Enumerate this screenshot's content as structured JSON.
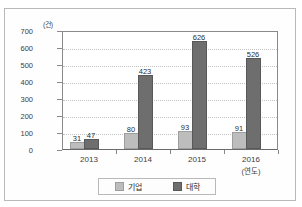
{
  "chart_data": {
    "type": "bar",
    "title": "",
    "xlabel": "(연도)",
    "ylabel": "(건)",
    "categories": [
      "2013",
      "2014",
      "2015",
      "2016"
    ],
    "series": [
      {
        "name": "기업",
        "values": [
          31,
          80,
          93,
          91
        ],
        "color": "#bdbdbd"
      },
      {
        "name": "대학",
        "values": [
          47,
          423,
          626,
          526
        ],
        "color": "#6e6e6e"
      }
    ],
    "ylim": [
      0,
      700
    ],
    "ytick_step": 100,
    "yticks": [
      "0",
      "100",
      "200",
      "300",
      "400",
      "500",
      "600",
      "700"
    ],
    "grid": true,
    "legend_position": "bottom"
  },
  "axis": {
    "unit_label": "(건)",
    "x_unit_label": "(연도)"
  },
  "legend": {
    "items": [
      {
        "label": "기업",
        "color": "#bdbdbd"
      },
      {
        "label": "대학",
        "color": "#6e6e6e"
      }
    ]
  }
}
